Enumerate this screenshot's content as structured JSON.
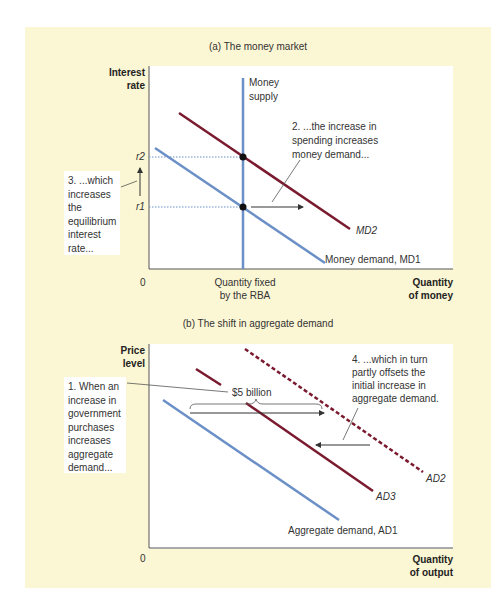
{
  "panel_a": {
    "title": "(a) The money market",
    "y_axis_label_1": "Interest",
    "y_axis_label_2": "rate",
    "x_axis_label_1": "Quantity",
    "x_axis_label_2": "of money",
    "origin": "0",
    "x_tick_1": "Quantity fixed",
    "x_tick_2": "by the RBA",
    "r2_label": "r2",
    "r1_label": "r1",
    "money_supply_1": "Money",
    "money_supply_2": "supply",
    "md2_label": "MD2",
    "md1_label": "Money demand, MD1",
    "note2": [
      "2. ...the increase in",
      "spending increases",
      "money demand..."
    ],
    "note3": [
      "3. ...which",
      "increases",
      "the",
      "equilibrium",
      "interest",
      "rate..."
    ]
  },
  "panel_b": {
    "title": "(b) The shift in aggregate demand",
    "y_axis_label_1": "Price",
    "y_axis_label_2": "level",
    "x_axis_label_1": "Quantity",
    "x_axis_label_2": "of output",
    "origin": "0",
    "shift_label": "$5 billion",
    "ad1_label": "Aggregate demand, AD1",
    "ad2_label": "AD2",
    "ad3_label": "AD3",
    "note1": [
      "1. When an",
      "increase in",
      "government",
      "purchases",
      "increases",
      "aggregate",
      "demand..."
    ],
    "note4": [
      "4. ...which in turn",
      "partly offsets the",
      "initial increase in",
      "aggregate demand."
    ]
  },
  "colors": {
    "background": "#fbf6d3",
    "money_supply": "#6b8fc7",
    "md1": "#6b8fc7",
    "md2": "#7a1a2e",
    "ad1": "#6b8fc7",
    "ad2": "#7a1a2e",
    "ad3": "#7a1a2e"
  }
}
